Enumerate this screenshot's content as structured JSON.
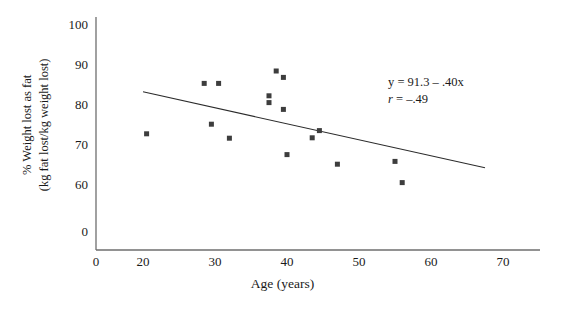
{
  "chart_data": {
    "type": "scatter",
    "title": "",
    "xlabel": "Age (years)",
    "ylabel": "% Weight lost as fat\n(kg fat lost/kg weight lost)",
    "ylabel_line1": "% Weight lost as fat",
    "ylabel_line2": "(kg fat lost/kg weight lost)",
    "xlim": [
      18,
      72
    ],
    "ylim": [
      57,
      102
    ],
    "x_ticks": [
      0,
      20,
      30,
      40,
      50,
      60,
      70
    ],
    "y_ticks": [
      0,
      60,
      70,
      80,
      90,
      100
    ],
    "axis_break": true,
    "grid": false,
    "legend": "none",
    "x": [
      20.5,
      28.5,
      30.5,
      29.5,
      32.0,
      37.5,
      37.5,
      38.5,
      39.5,
      39.5,
      40.0,
      43.5,
      44.5,
      47.0,
      55.0,
      56.0
    ],
    "y": [
      72.8,
      85.4,
      85.4,
      75.2,
      71.7,
      82.3,
      80.6,
      88.5,
      86.9,
      78.9,
      67.6,
      71.8,
      73.6,
      65.2,
      65.9,
      60.6
    ],
    "points": [
      {
        "x": 20.5,
        "y": 72.8
      },
      {
        "x": 28.5,
        "y": 85.4
      },
      {
        "x": 30.5,
        "y": 85.4
      },
      {
        "x": 29.5,
        "y": 75.2
      },
      {
        "x": 32.0,
        "y": 71.7
      },
      {
        "x": 37.5,
        "y": 82.3
      },
      {
        "x": 37.5,
        "y": 80.6
      },
      {
        "x": 38.5,
        "y": 88.5
      },
      {
        "x": 39.5,
        "y": 86.9
      },
      {
        "x": 39.5,
        "y": 78.9
      },
      {
        "x": 40.0,
        "y": 67.6
      },
      {
        "x": 43.5,
        "y": 71.8
      },
      {
        "x": 44.5,
        "y": 73.6
      },
      {
        "x": 47.0,
        "y": 65.2
      },
      {
        "x": 55.0,
        "y": 65.9
      },
      {
        "x": 56.0,
        "y": 60.6
      }
    ],
    "marker": {
      "shape": "square",
      "color": "#3d3d3d",
      "size": 5
    },
    "regression_line": {
      "slope": -0.4,
      "intercept": 91.3,
      "x_start": 20.0,
      "x_end": 67.5,
      "color": "#2b2b2b",
      "width": 1.1
    },
    "annotations": {
      "equation": "y = 91.3 – .40x",
      "correlation_label": "r",
      "correlation_value": " = –.49"
    },
    "axis_color": "#6e6e6e"
  },
  "x_tick_labels": [
    "0",
    "20",
    "30",
    "40",
    "50",
    "60",
    "70"
  ],
  "y_tick_labels": [
    "0",
    "60",
    "70",
    "80",
    "90",
    "100"
  ]
}
